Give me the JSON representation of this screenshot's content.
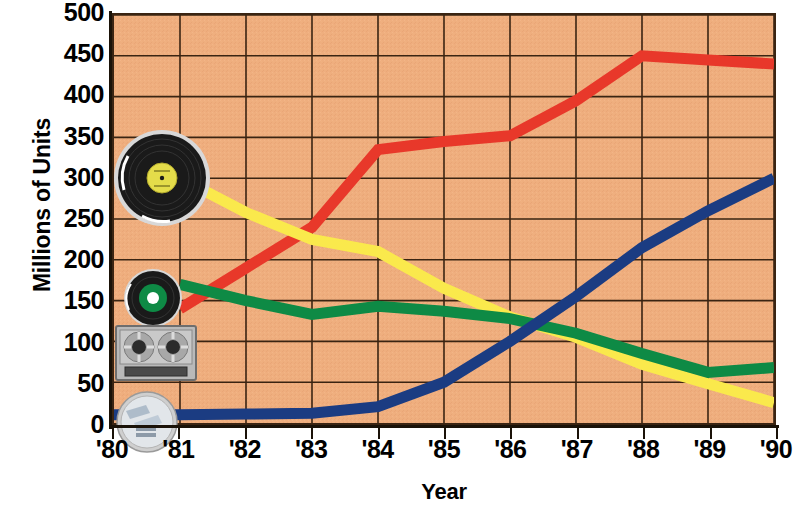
{
  "chart_data": {
    "type": "line",
    "title": "",
    "xlabel": "Year",
    "ylabel": "Millions of Units",
    "xlim": [
      1980,
      1990
    ],
    "ylim": [
      0,
      500
    ],
    "ytick_labels": [
      "500",
      "450",
      "400",
      "350",
      "300",
      "250",
      "200",
      "150",
      "100",
      "50",
      "0"
    ],
    "ytick_values": [
      500,
      450,
      400,
      350,
      300,
      250,
      200,
      150,
      100,
      50,
      0
    ],
    "xtick_labels": [
      "'80",
      "'81",
      "'82",
      "'83",
      "'84",
      "'85",
      "'86",
      "'87",
      "'88",
      "'89",
      "'90"
    ],
    "x": [
      1980,
      1981,
      1982,
      1983,
      1984,
      1985,
      1986,
      1987,
      1988,
      1989,
      1990
    ],
    "grid": true,
    "legend_position": "inline-icons",
    "plot_background": "#efae7e",
    "series": [
      {
        "name": "Cassette",
        "icon": "cassette-tape-icon",
        "color": "#e8382a",
        "x": [
          1981,
          1982,
          1983,
          1984,
          1985,
          1986,
          1987,
          1988,
          1989,
          1990
        ],
        "values": [
          140,
          190,
          240,
          335,
          345,
          352,
          395,
          450,
          445,
          440
        ]
      },
      {
        "name": "LP Album",
        "icon": "vinyl-lp-record-icon",
        "color": "#fae94c",
        "x": [
          1981,
          1982,
          1983,
          1984,
          1985,
          1986,
          1987,
          1988,
          1989,
          1990
        ],
        "values": [
          300,
          258,
          225,
          210,
          165,
          130,
          105,
          72,
          48,
          25
        ]
      },
      {
        "name": "Single",
        "icon": "vinyl-single-record-icon",
        "color": "#0e8a45",
        "x": [
          1981,
          1982,
          1983,
          1984,
          1985,
          1986,
          1987,
          1988,
          1989,
          1990
        ],
        "values": [
          170,
          150,
          133,
          143,
          137,
          128,
          110,
          85,
          62,
          68
        ]
      },
      {
        "name": "Compact Disc",
        "icon": "compact-disc-icon",
        "color": "#1b3c82",
        "x": [
          1980,
          1981,
          1982,
          1983,
          1984,
          1985,
          1986,
          1987,
          1988,
          1989,
          1990
        ],
        "values": [
          10,
          10,
          11,
          12,
          20,
          50,
          100,
          155,
          215,
          260,
          300
        ]
      }
    ],
    "markers": [
      {
        "name": "vinyl-lp-record-icon",
        "label": "LP Album",
        "series_color": "#fae94c",
        "x_px": 150,
        "y_px": 163
      },
      {
        "name": "vinyl-single-record-icon",
        "label": "Single",
        "series_color": "#0e8a45",
        "x_px": 139,
        "y_px": 283
      },
      {
        "name": "cassette-tape-icon",
        "label": "Cassette",
        "series_color": "#e8382a",
        "x_px": 139,
        "y_px": 337
      },
      {
        "name": "compact-disc-icon",
        "label": "Compact Disc",
        "series_color": "#1b3c82",
        "x_px": 135,
        "y_px": 408
      }
    ]
  },
  "axes": {
    "y_title": "Millions of Units",
    "x_title": "Year"
  }
}
